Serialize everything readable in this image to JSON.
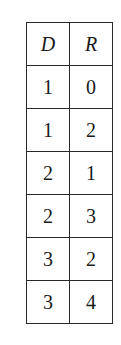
{
  "table": {
    "headers": [
      "D",
      "R"
    ],
    "rows": [
      [
        "1",
        "0"
      ],
      [
        "1",
        "2"
      ],
      [
        "2",
        "1"
      ],
      [
        "2",
        "3"
      ],
      [
        "3",
        "2"
      ],
      [
        "3",
        "4"
      ]
    ]
  }
}
